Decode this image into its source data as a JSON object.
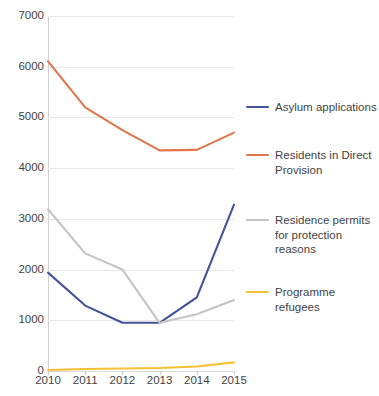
{
  "chart_data": {
    "type": "line",
    "title": "",
    "xlabel": "",
    "ylabel": "",
    "categories": [
      "2010",
      "2011",
      "2012",
      "2013",
      "2014",
      "2015"
    ],
    "x": [
      2010,
      2011,
      2012,
      2013,
      2014,
      2015
    ],
    "ylim": [
      0,
      7000
    ],
    "y_ticks": [
      0,
      1000,
      2000,
      3000,
      4000,
      5000,
      6000,
      7000
    ],
    "y_tick_labels": [
      "0",
      "1000",
      "2000",
      "3000",
      "4000",
      "5000",
      "6000",
      "7000"
    ],
    "grid": "horizontal",
    "legend_position": "right",
    "series": [
      {
        "name": "Asylum applications",
        "color": "#45519b",
        "values": [
          1940,
          1290,
          950,
          950,
          1450,
          3280
        ]
      },
      {
        "name": "Residents in Direct Provision",
        "color": "#e2754b",
        "values": [
          6107,
          5200,
          4750,
          4350,
          4360,
          4700
        ]
      },
      {
        "name": "Residence permits for protection reasons",
        "color": "#c4c4c4",
        "values": [
          3190,
          2320,
          2000,
          950,
          1120,
          1400
        ]
      },
      {
        "name": "Programme refugees",
        "color": "#f5c033",
        "values": [
          20,
          40,
          50,
          60,
          90,
          170
        ]
      }
    ]
  },
  "legend": {
    "entries": [
      {
        "label": "Asylum applications",
        "color": "#45519b"
      },
      {
        "label": "Residents in Direct\nProvision",
        "color": "#e2754b"
      },
      {
        "label": "Residence permits\nfor protection\nreasons",
        "color": "#c4c4c4"
      },
      {
        "label": "Programme refugees",
        "color": "#f5c033"
      }
    ]
  },
  "colors": {
    "asylum_applications": "#45519b",
    "direct_provision": "#e2754b",
    "residence_permits": "#c4c4c4",
    "programme_refugees": "#f5c033",
    "grid": "#e8e8e8",
    "axis": "#d0d0d0",
    "text": "#3f3f3f",
    "background": "#ffffff"
  }
}
